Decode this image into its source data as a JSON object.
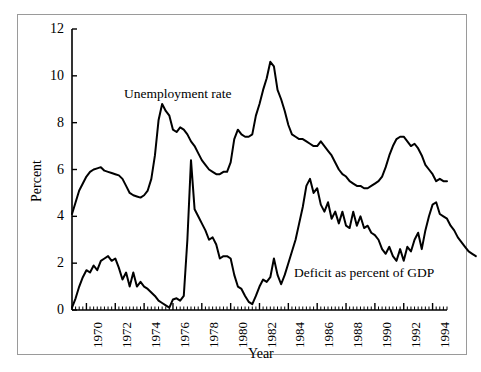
{
  "chart_data": {
    "type": "line",
    "title": "",
    "xlabel": "Year",
    "ylabel": "Percent",
    "xlim": [
      1969.0,
      1995.0
    ],
    "ylim": [
      0,
      12
    ],
    "yticks": [
      0,
      2,
      4,
      6,
      8,
      10,
      12
    ],
    "ytick_labels": [
      "0",
      "2",
      "4",
      "6",
      "8",
      "10",
      "12"
    ],
    "xticks": [
      1970,
      1972,
      1974,
      1976,
      1978,
      1980,
      1982,
      1984,
      1986,
      1988,
      1990,
      1992,
      1994
    ],
    "xtick_labels": [
      "1970",
      "1972",
      "1974",
      "1976",
      "1978",
      "1980",
      "1982",
      "1984",
      "1986",
      "1988",
      "1990",
      "1992",
      "1994"
    ],
    "minor_tick_interval": 0.25,
    "grid": false,
    "legend_position": "inline-annotation",
    "axis_color": "#000000",
    "line_color": "#000000",
    "background_color": "#ffffff",
    "x_start": 1969.0,
    "x_step": 0.25,
    "series": [
      {
        "name": "Unemployment rate",
        "annotation": "Unemployment rate",
        "annotation_x": 1972.6,
        "annotation_y": 9.2,
        "values": [
          4.1,
          4.6,
          5.1,
          5.4,
          5.7,
          5.9,
          6.0,
          6.05,
          6.1,
          5.95,
          5.9,
          5.85,
          5.8,
          5.75,
          5.6,
          5.3,
          5.0,
          4.9,
          4.85,
          4.8,
          4.9,
          5.1,
          5.6,
          6.6,
          8.1,
          8.8,
          8.5,
          8.3,
          7.7,
          7.6,
          7.8,
          7.7,
          7.5,
          7.2,
          7.0,
          6.7,
          6.4,
          6.2,
          6.0,
          5.9,
          5.8,
          5.8,
          5.9,
          5.9,
          6.3,
          7.3,
          7.7,
          7.5,
          7.4,
          7.4,
          7.5,
          8.3,
          8.8,
          9.4,
          9.9,
          10.6,
          10.4,
          9.4,
          9.0,
          8.5,
          7.9,
          7.5,
          7.4,
          7.3,
          7.3,
          7.2,
          7.1,
          7.0,
          7.0,
          7.2,
          7.0,
          6.8,
          6.6,
          6.3,
          6.0,
          5.8,
          5.7,
          5.5,
          5.4,
          5.3,
          5.3,
          5.2,
          5.2,
          5.3,
          5.4,
          5.5,
          5.7,
          6.1,
          6.6,
          7.0,
          7.3,
          7.4,
          7.4,
          7.2,
          7.0,
          7.1,
          6.9,
          6.6,
          6.2,
          6.0,
          5.8,
          5.5,
          5.6,
          5.5,
          5.5
        ]
      },
      {
        "name": "Deficit as percent of GDP",
        "annotation": "Deficit as percent of GDP",
        "annotation_x": 1984.4,
        "annotation_y": 1.55,
        "values": [
          0.1,
          0.5,
          1.0,
          1.4,
          1.7,
          1.6,
          1.9,
          1.7,
          2.1,
          2.2,
          2.3,
          2.1,
          2.2,
          1.8,
          1.3,
          1.6,
          1.0,
          1.6,
          1.0,
          1.2,
          1.0,
          0.9,
          0.75,
          0.6,
          0.4,
          0.3,
          0.2,
          0.1,
          0.45,
          0.5,
          0.4,
          0.6,
          3.0,
          6.4,
          4.3,
          4.0,
          3.7,
          3.4,
          3.0,
          3.1,
          2.8,
          2.2,
          2.3,
          2.3,
          2.2,
          1.5,
          1.0,
          0.9,
          0.6,
          0.35,
          0.25,
          0.6,
          1.0,
          1.3,
          1.2,
          1.4,
          2.2,
          1.5,
          1.1,
          1.5,
          2.0,
          2.5,
          3.0,
          3.7,
          4.4,
          5.3,
          5.6,
          5.0,
          5.2,
          4.5,
          4.2,
          4.6,
          3.9,
          4.2,
          3.7,
          4.2,
          3.6,
          3.5,
          4.2,
          3.6,
          4.0,
          3.5,
          3.6,
          3.3,
          3.2,
          3.0,
          2.6,
          2.4,
          2.7,
          2.3,
          2.1,
          2.6,
          2.1,
          2.7,
          2.5,
          3.0,
          3.3,
          2.6,
          3.4,
          4.0,
          4.5,
          4.6,
          4.1,
          4.0,
          3.9,
          3.6,
          3.4,
          3.1,
          2.9,
          2.7,
          2.5,
          2.4,
          2.3
        ]
      }
    ]
  },
  "axes": {
    "y_axis_label": "Percent",
    "x_axis_label": "Year"
  }
}
